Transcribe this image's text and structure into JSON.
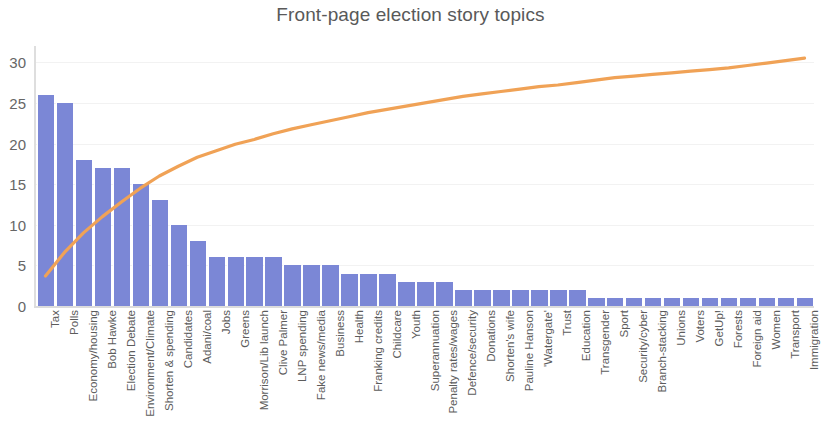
{
  "chart_data": {
    "type": "bar",
    "title": "Front-page election story topics",
    "xlabel": "",
    "ylabel": "",
    "ylim": [
      0,
      32
    ],
    "yticks": [
      0,
      5,
      10,
      15,
      20,
      25,
      30
    ],
    "grid": true,
    "legend": false,
    "categories": [
      "Tax",
      "Polls",
      "Economy/housing",
      "Bob Hawke",
      "Election Debate",
      "Environment/Climate",
      "Shorten & spending",
      "Candidates",
      "Adani/coal",
      "Jobs",
      "Greens",
      "Morrison/Lib launch",
      "Clive Palmer",
      "LNP spending",
      "Fake news/media",
      "Business",
      "Health",
      "Franking credits",
      "Childcare",
      "Youth",
      "Superannuation",
      "Penalty rates/wages",
      "Defence/security",
      "Donations",
      "Shorten's wife",
      "Pauline Hanson",
      "'Watergate'",
      "Trust",
      "Education",
      "Transgender",
      "Sport",
      "Security/cyber",
      "Branch-stacking",
      "Unions",
      "Voters",
      "GetUp!",
      "Forests",
      "Foreign aid",
      "Women",
      "Transport",
      "Immigration"
    ],
    "series": [
      {
        "name": "Story count",
        "type": "bar",
        "color": "#7b87d6",
        "values": [
          26,
          25,
          18,
          17,
          17,
          15,
          13,
          10,
          8,
          6,
          6,
          6,
          6,
          5,
          5,
          5,
          4,
          4,
          4,
          3,
          3,
          3,
          2,
          2,
          2,
          2,
          2,
          2,
          2,
          1,
          1,
          1,
          1,
          1,
          1,
          1,
          1,
          1,
          1,
          1,
          1
        ]
      },
      {
        "name": "Cumulative",
        "type": "line",
        "color": "#f0a256",
        "axis": "scaled-to-left",
        "values": [
          3.7,
          6.6,
          9.0,
          11.0,
          12.8,
          14.5,
          16.0,
          17.2,
          18.3,
          19.1,
          19.9,
          20.5,
          21.2,
          21.8,
          22.3,
          22.8,
          23.3,
          23.8,
          24.2,
          24.6,
          25.0,
          25.4,
          25.8,
          26.1,
          26.4,
          26.7,
          27.0,
          27.2,
          27.5,
          27.8,
          28.1,
          28.3,
          28.5,
          28.7,
          28.9,
          29.1,
          29.3,
          29.6,
          29.9,
          30.2,
          30.5
        ]
      }
    ]
  },
  "colors": {
    "bar": "#7b87d6",
    "line": "#f0a256",
    "text": "#5a5a5a",
    "grid": "#f2f2f2",
    "axis": "#dcdcdc",
    "background": "#ffffff"
  }
}
